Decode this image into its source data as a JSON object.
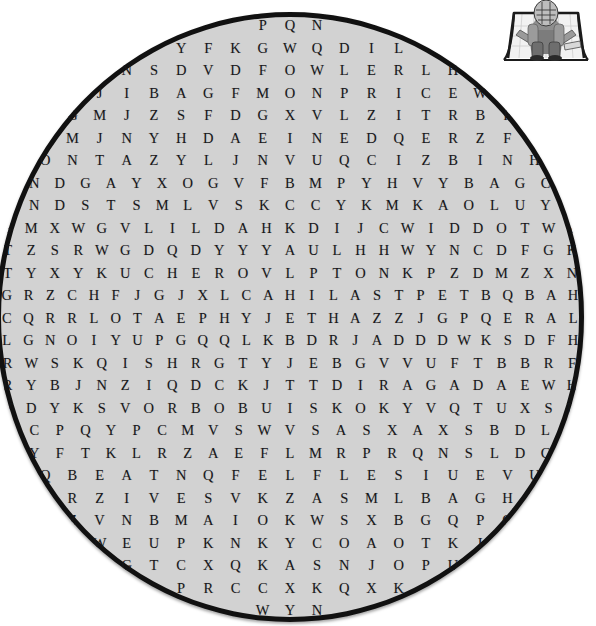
{
  "puzzle": {
    "shape": "circle",
    "disc_fill_color": "#d2d2d2",
    "disc_border_color": "#111111",
    "letter_color": "#17171a",
    "rows": [
      [
        "P",
        "Q",
        "N"
      ],
      [
        "Y",
        "F",
        "K",
        "G",
        "W",
        "Q",
        "D",
        "I",
        "L"
      ],
      [
        "N",
        "S",
        "D",
        "V",
        "D",
        "F",
        "O",
        "W",
        "L",
        "E",
        "R",
        "L",
        "H"
      ],
      [
        "A",
        "J",
        "I",
        "B",
        "A",
        "G",
        "F",
        "M",
        "O",
        "N",
        "P",
        "R",
        "I",
        "C",
        "E",
        "W",
        "P"
      ],
      [
        "D",
        "G",
        "M",
        "J",
        "Z",
        "S",
        "F",
        "D",
        "G",
        "X",
        "V",
        "L",
        "Z",
        "I",
        "T",
        "R",
        "B",
        "F",
        "Y"
      ],
      [
        "R",
        "F",
        "M",
        "J",
        "N",
        "Y",
        "H",
        "D",
        "A",
        "E",
        "I",
        "N",
        "E",
        "D",
        "Q",
        "E",
        "R",
        "Z",
        "F",
        "T",
        "H"
      ],
      [
        "A",
        "O",
        "N",
        "T",
        "A",
        "Z",
        "Y",
        "L",
        "J",
        "N",
        "V",
        "U",
        "Q",
        "C",
        "I",
        "Z",
        "B",
        "I",
        "N",
        "H",
        "K"
      ],
      [
        "J",
        "N",
        "D",
        "G",
        "A",
        "Y",
        "X",
        "O",
        "G",
        "V",
        "F",
        "B",
        "M",
        "P",
        "Y",
        "H",
        "V",
        "Y",
        "B",
        "A",
        "G",
        "C",
        "L"
      ],
      [
        "D",
        "N",
        "D",
        "S",
        "T",
        "S",
        "M",
        "L",
        "V",
        "S",
        "K",
        "C",
        "C",
        "Y",
        "K",
        "M",
        "K",
        "A",
        "O",
        "L",
        "U",
        "Y",
        "O"
      ],
      [
        "S",
        "M",
        "X",
        "W",
        "G",
        "V",
        "L",
        "I",
        "L",
        "D",
        "A",
        "H",
        "K",
        "D",
        "I",
        "J",
        "C",
        "W",
        "I",
        "D",
        "D",
        "O",
        "T",
        "W",
        "I"
      ],
      [
        "T",
        "Z",
        "S",
        "R",
        "W",
        "G",
        "D",
        "Q",
        "D",
        "Y",
        "Y",
        "Y",
        "A",
        "U",
        "L",
        "H",
        "H",
        "W",
        "Y",
        "N",
        "C",
        "D",
        "F",
        "G",
        "K"
      ],
      [
        "T",
        "Y",
        "X",
        "Y",
        "K",
        "U",
        "C",
        "H",
        "E",
        "R",
        "O",
        "V",
        "L",
        "P",
        "T",
        "O",
        "N",
        "K",
        "P",
        "Z",
        "D",
        "M",
        "Z",
        "X",
        "N"
      ],
      [
        "G",
        "R",
        "Z",
        "C",
        "H",
        "F",
        "J",
        "G",
        "J",
        "X",
        "L",
        "C",
        "A",
        "H",
        "I",
        "L",
        "A",
        "S",
        "T",
        "P",
        "E",
        "T",
        "B",
        "Q",
        "B",
        "A",
        "H"
      ],
      [
        "C",
        "Q",
        "R",
        "R",
        "L",
        "O",
        "T",
        "A",
        "E",
        "P",
        "H",
        "Y",
        "J",
        "E",
        "T",
        "H",
        "A",
        "Z",
        "Z",
        "J",
        "G",
        "P",
        "Q",
        "E",
        "R",
        "A",
        "L"
      ],
      [
        "L",
        "G",
        "N",
        "O",
        "I",
        "Y",
        "U",
        "P",
        "G",
        "Q",
        "Q",
        "L",
        "K",
        "B",
        "D",
        "R",
        "J",
        "A",
        "D",
        "D",
        "D",
        "W",
        "K",
        "S",
        "D",
        "F",
        "H"
      ],
      [
        "R",
        "W",
        "S",
        "K",
        "Q",
        "I",
        "S",
        "H",
        "R",
        "G",
        "T",
        "Y",
        "J",
        "E",
        "B",
        "G",
        "V",
        "V",
        "U",
        "F",
        "T",
        "B",
        "B",
        "R",
        "F"
      ],
      [
        "R",
        "Y",
        "B",
        "J",
        "N",
        "Z",
        "I",
        "Q",
        "D",
        "C",
        "K",
        "J",
        "T",
        "T",
        "D",
        "I",
        "R",
        "A",
        "G",
        "A",
        "D",
        "A",
        "E",
        "W",
        "H"
      ],
      [
        "V",
        "D",
        "Y",
        "K",
        "S",
        "V",
        "O",
        "R",
        "B",
        "O",
        "B",
        "U",
        "I",
        "S",
        "K",
        "O",
        "K",
        "Y",
        "V",
        "Q",
        "T",
        "U",
        "X",
        "S",
        "D"
      ],
      [
        "D",
        "C",
        "P",
        "Q",
        "Y",
        "P",
        "C",
        "M",
        "V",
        "S",
        "W",
        "V",
        "S",
        "A",
        "S",
        "X",
        "A",
        "X",
        "S",
        "B",
        "D",
        "L",
        "Z"
      ],
      [
        "S",
        "Y",
        "F",
        "T",
        "K",
        "L",
        "R",
        "Z",
        "A",
        "E",
        "F",
        "L",
        "M",
        "R",
        "P",
        "R",
        "Q",
        "N",
        "S",
        "L",
        "D",
        "C",
        "J"
      ],
      [
        "Z",
        "Q",
        "B",
        "E",
        "A",
        "T",
        "N",
        "Q",
        "F",
        "E",
        "L",
        "F",
        "L",
        "E",
        "S",
        "I",
        "U",
        "E",
        "V",
        "U",
        "S"
      ],
      [
        "F",
        "U",
        "R",
        "Z",
        "I",
        "V",
        "E",
        "S",
        "V",
        "K",
        "Z",
        "A",
        "S",
        "M",
        "L",
        "B",
        "A",
        "G",
        "H",
        "Y",
        "D"
      ],
      [
        "J",
        "Z",
        "V",
        "N",
        "B",
        "M",
        "A",
        "I",
        "O",
        "K",
        "W",
        "S",
        "X",
        "B",
        "G",
        "Q",
        "P",
        "G",
        "G"
      ],
      [
        "I",
        "W",
        "E",
        "U",
        "P",
        "K",
        "N",
        "K",
        "Y",
        "C",
        "O",
        "A",
        "O",
        "T",
        "K",
        "I",
        "F"
      ],
      [
        "G",
        "T",
        "C",
        "X",
        "Q",
        "K",
        "A",
        "S",
        "N",
        "J",
        "O",
        "P",
        "U"
      ],
      [
        "P",
        "R",
        "C",
        "C",
        "X",
        "K",
        "Q",
        "X",
        "K"
      ],
      [
        "W",
        "Y",
        "N"
      ]
    ]
  },
  "decoration": {
    "clipart_name": "hockey-goalie-in-net",
    "description": "Grayscale illustration of an ice hockey goalie crouching in front of a goal net"
  }
}
